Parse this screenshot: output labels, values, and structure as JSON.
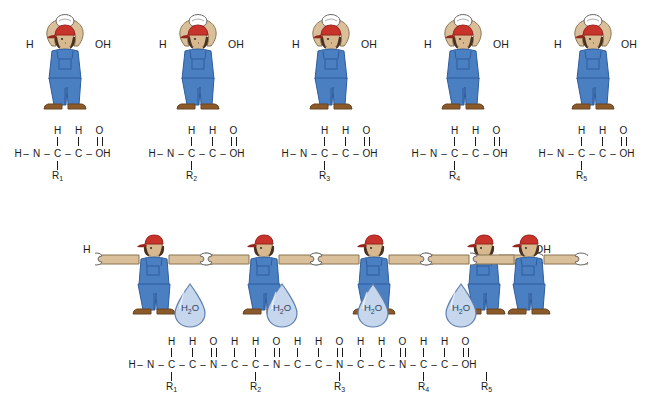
{
  "diagram": {
    "ghost_header": "       ",
    "colors": {
      "overalls_blue": "#4a7fc1",
      "overalls_blue_dark": "#2f5d9e",
      "cap_red": "#c8342c",
      "cap_red_dark": "#97231d",
      "skin": "#d8b98f",
      "arm_tan": "#d9c09a",
      "shoe_brown": "#8a5a2b",
      "shoe_brown_dark": "#6b4420",
      "shirt_white": "#ffffff",
      "droplet_fill": "#c6d6ec",
      "droplet_stroke": "#5e7fae",
      "text_black": "#1a1a1a",
      "outline": "#3a3a3a"
    },
    "top_section": {
      "label": "Five individual amino acids",
      "amino_acids": [
        {
          "index": 1,
          "left_label": "H",
          "right_label": "OH",
          "figure_name": "amino-acid-figure-1",
          "formula": {
            "h_left": "H",
            "n": "N",
            "n_h": "H",
            "alpha_c": "C",
            "alpha_h": "H",
            "carbonyl_c": "C",
            "carbonyl_o": "O",
            "oh": "OH",
            "r_group": "R",
            "r_sub": "1"
          }
        },
        {
          "index": 2,
          "left_label": "H",
          "right_label": "OH",
          "figure_name": "amino-acid-figure-2",
          "formula": {
            "h_left": "H",
            "n": "N",
            "n_h": "H",
            "alpha_c": "C",
            "alpha_h": "H",
            "carbonyl_c": "C",
            "carbonyl_o": "O",
            "oh": "OH",
            "r_group": "R",
            "r_sub": "2"
          }
        },
        {
          "index": 3,
          "left_label": "H",
          "right_label": "OH",
          "figure_name": "amino-acid-figure-3",
          "formula": {
            "h_left": "H",
            "n": "N",
            "n_h": "H",
            "alpha_c": "C",
            "alpha_h": "H",
            "carbonyl_c": "C",
            "carbonyl_o": "O",
            "oh": "OH",
            "r_group": "R",
            "r_sub": "3"
          }
        },
        {
          "index": 4,
          "left_label": "H",
          "right_label": "OH",
          "figure_name": "amino-acid-figure-4",
          "formula": {
            "h_left": "H",
            "n": "N",
            "n_h": "H",
            "alpha_c": "C",
            "alpha_h": "H",
            "carbonyl_c": "C",
            "carbonyl_o": "O",
            "oh": "OH",
            "r_group": "R",
            "r_sub": "4"
          }
        },
        {
          "index": 5,
          "left_label": "H",
          "right_label": "OH",
          "figure_name": "amino-acid-figure-5",
          "formula": {
            "h_left": "H",
            "n": "N",
            "n_h": "H",
            "alpha_c": "C",
            "alpha_h": "H",
            "carbonyl_c": "C",
            "carbonyl_o": "O",
            "oh": "OH",
            "r_group": "R",
            "r_sub": "5"
          }
        }
      ]
    },
    "bottom_section": {
      "label": "Polypeptide chain formed by condensation (dehydration synthesis)",
      "chain_end_left": "H",
      "chain_end_right": "OH",
      "figures": [
        {
          "index": 1,
          "name": "chain-figure-1"
        },
        {
          "index": 2,
          "name": "chain-figure-2"
        },
        {
          "index": 3,
          "name": "chain-figure-3"
        },
        {
          "index": 4,
          "name": "chain-figure-4"
        },
        {
          "index": 5,
          "name": "chain-figure-5"
        }
      ],
      "water_molecules": [
        {
          "index": 1,
          "formula": "H",
          "sub": "2",
          "element": "O"
        },
        {
          "index": 2,
          "formula": "H",
          "sub": "2",
          "element": "O"
        },
        {
          "index": 3,
          "formula": "H",
          "sub": "2",
          "element": "O"
        },
        {
          "index": 4,
          "formula": "H",
          "sub": "2",
          "element": "O"
        }
      ],
      "chain_formula": {
        "terminal_h": "H",
        "terminal_oh": "OH",
        "residues": [
          {
            "n": "N",
            "n_h": "H",
            "alpha_c": "C",
            "alpha_h": "H",
            "carbonyl_c": "C",
            "carbonyl_o": "O",
            "r_group": "R",
            "r_sub": "1"
          },
          {
            "n": "N",
            "n_h": "H",
            "alpha_c": "C",
            "alpha_h": "H",
            "carbonyl_c": "C",
            "carbonyl_o": "O",
            "r_group": "R",
            "r_sub": "2"
          },
          {
            "n": "N",
            "n_h": "H",
            "alpha_c": "C",
            "alpha_h": "H",
            "carbonyl_c": "C",
            "carbonyl_o": "O",
            "r_group": "R",
            "r_sub": "3"
          },
          {
            "n": "N",
            "n_h": "H",
            "alpha_c": "C",
            "alpha_h": "H",
            "carbonyl_c": "C",
            "carbonyl_o": "O",
            "r_group": "R",
            "r_sub": "4"
          },
          {
            "n": "N",
            "n_h": "H",
            "alpha_c": "C",
            "alpha_h": "H",
            "carbonyl_c": "C",
            "carbonyl_o": "O",
            "r_group": "R",
            "r_sub": "5"
          }
        ]
      }
    }
  }
}
